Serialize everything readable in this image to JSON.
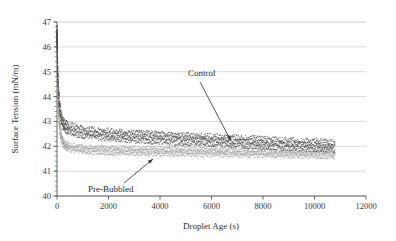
{
  "chart_data": {
    "type": "scatter",
    "title": "",
    "xlabel": "Droplet Age (s)",
    "ylabel": "Surface Tension (mN/m)",
    "xlim": [
      0,
      12000
    ],
    "ylim": [
      40,
      47
    ],
    "xticks": [
      0,
      2000,
      4000,
      6000,
      8000,
      10000,
      12000
    ],
    "xtick_labels": [
      "0",
      "2000",
      "4000",
      "6000",
      "8000",
      "10000",
      "12000"
    ],
    "yticks": [
      40,
      41,
      42,
      43,
      44,
      45,
      46,
      47
    ],
    "ytick_labels": [
      "40",
      "41",
      "42",
      "43",
      "44",
      "45",
      "46",
      "47"
    ],
    "grid": "horizontal",
    "legend_position": "inline-annotations",
    "data_end_x": 10800,
    "series": [
      {
        "name": "Control",
        "color": "#4a4a4a",
        "band_half_width": 0.18,
        "x": [
          0,
          15,
          30,
          50,
          75,
          110,
          150,
          200,
          260,
          330,
          420,
          520,
          650,
          800,
          1000,
          1250,
          1550,
          1900,
          2300,
          2750,
          3250,
          3800,
          4400,
          5000,
          5600,
          6200,
          6800,
          7400,
          8000,
          8600,
          9200,
          9800,
          10300,
          10800
        ],
        "y": [
          46.5,
          45.6,
          44.9,
          44.3,
          43.9,
          43.5,
          43.2,
          43.0,
          42.88,
          42.8,
          42.74,
          42.7,
          42.66,
          42.62,
          42.58,
          42.54,
          42.5,
          42.47,
          42.44,
          42.41,
          42.38,
          42.35,
          42.32,
          42.29,
          42.26,
          42.23,
          42.2,
          42.17,
          42.14,
          42.11,
          42.08,
          42.05,
          42.03,
          42.0
        ]
      },
      {
        "name": "Pre-Bubbled",
        "color": "#9a9a9a",
        "band_half_width": 0.13,
        "x": [
          0,
          15,
          30,
          50,
          75,
          110,
          150,
          200,
          260,
          330,
          420,
          520,
          650,
          800,
          1000,
          1250,
          1550,
          1900,
          2300,
          2750,
          3250,
          3800,
          4400,
          5000,
          5600,
          6200,
          6800,
          7400,
          8000,
          8600,
          9200,
          9800,
          10300,
          10800
        ],
        "y": [
          46.2,
          45.0,
          44.2,
          43.6,
          43.1,
          42.7,
          42.42,
          42.25,
          42.12,
          42.04,
          41.99,
          41.95,
          41.92,
          41.9,
          41.88,
          41.86,
          41.85,
          41.84,
          41.83,
          41.82,
          41.81,
          41.8,
          41.79,
          41.78,
          41.77,
          41.76,
          41.75,
          41.74,
          41.73,
          41.72,
          41.71,
          41.7,
          41.69,
          41.68
        ]
      }
    ],
    "annotations": [
      {
        "name": "control",
        "text": "Control",
        "label_x": 188,
        "label_y": 76,
        "arrow_from_x": 200,
        "arrow_from_y": 82,
        "arrow_to_x": 231,
        "arrow_to_y": 141
      },
      {
        "name": "pre-bubbled",
        "text": "Pre-Bubbled",
        "label_x": 88,
        "label_y": 192,
        "arrow_from_x": 124,
        "arrow_from_y": 183,
        "arrow_to_x": 153,
        "arrow_to_y": 159
      }
    ],
    "axis": {
      "left_px": 57,
      "right_px": 366,
      "top_px": 22,
      "bottom_px": 196
    },
    "colors": {
      "grid": "#c9c9c9",
      "axis": "#555555",
      "text": "#2a2a2a",
      "control": "#4a4a4a",
      "prebubbled": "#9a9a9a"
    }
  }
}
